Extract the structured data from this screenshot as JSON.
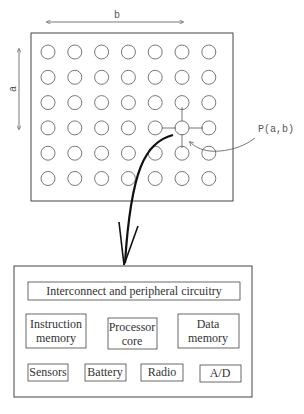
{
  "grid": {
    "rows": 6,
    "cols": 7,
    "dimension_a_label": "a",
    "dimension_b_label": "b",
    "highlighted_node": {
      "row": 3,
      "col": 5
    },
    "node_label": "P(a,b)"
  },
  "node_detail": {
    "top_label": "Interconnect and peripheral circuitry",
    "middle_row": [
      {
        "line1": "Instruction",
        "line2": "memory"
      },
      {
        "line1": "Processor",
        "line2": "core"
      },
      {
        "line1": "Data",
        "line2": "memory"
      }
    ],
    "bottom_row": [
      "Sensors",
      "Battery",
      "Radio",
      "A/D"
    ]
  },
  "colors": {
    "stroke": "#444444",
    "text": "#333333",
    "arrow": "#111111"
  }
}
